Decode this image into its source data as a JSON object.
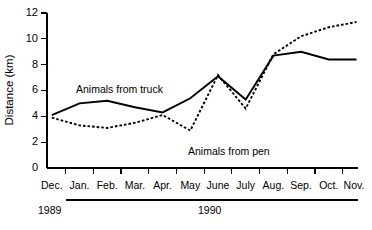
{
  "chart_data": {
    "type": "line",
    "title": "",
    "xlabel": "",
    "ylabel": "Distance (km)",
    "ylim": [
      0,
      12
    ],
    "yticks": [
      0,
      2,
      4,
      6,
      8,
      10,
      12
    ],
    "ytick_labels": [
      "0",
      "2",
      "4",
      "6",
      "8",
      "10",
      "12"
    ],
    "grid": false,
    "legend_position": "inline-annotations",
    "categories": [
      "Dec.",
      "Jan.",
      "Feb.",
      "Mar.",
      "Apr.",
      "May",
      "June",
      "July",
      "Aug.",
      "Sep.",
      "Oct.",
      "Nov."
    ],
    "series": [
      {
        "name": "Animals from truck",
        "style": "solid",
        "values": [
          4.1,
          5.0,
          5.2,
          4.7,
          4.3,
          5.4,
          7.1,
          5.3,
          8.7,
          9.0,
          8.4,
          8.4
        ]
      },
      {
        "name": "Animals from pen",
        "style": "dashed",
        "values": [
          3.9,
          3.3,
          3.1,
          3.5,
          4.1,
          2.9,
          7.2,
          4.6,
          8.8,
          10.2,
          10.9,
          11.3
        ]
      }
    ],
    "annotations": [
      {
        "text": "Animals from truck",
        "category": "Jan.",
        "value": 6.0
      },
      {
        "text": "Animals from pen",
        "category": "July",
        "value": 2.4
      }
    ],
    "year_groups": [
      {
        "label": "1989",
        "start": "Dec.",
        "end": "Dec.",
        "rule": false
      },
      {
        "label": "1990",
        "start": "Jan.",
        "end": "Nov.",
        "rule": true
      }
    ]
  }
}
